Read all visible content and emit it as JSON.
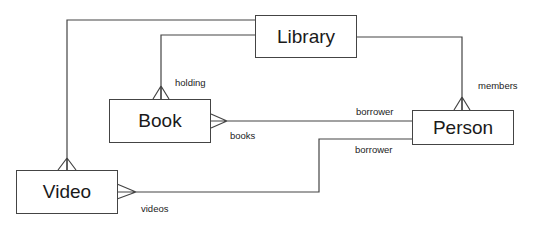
{
  "diagram": {
    "type": "entity-relationship",
    "line_color": "#444444",
    "entities": [
      {
        "id": "library",
        "label": "Library"
      },
      {
        "id": "book",
        "label": "Book"
      },
      {
        "id": "person",
        "label": "Person"
      },
      {
        "id": "video",
        "label": "Video"
      }
    ],
    "relationships": [
      {
        "from": "library",
        "to": "book",
        "role": "holding",
        "many_end": "book"
      },
      {
        "from": "library",
        "to": "video",
        "role": "",
        "many_end": "video"
      },
      {
        "from": "library",
        "to": "person",
        "role": "members",
        "many_end": "person"
      },
      {
        "from": "book",
        "to": "person",
        "roles": [
          "books",
          "borrower"
        ],
        "many_end": "book"
      },
      {
        "from": "video",
        "to": "person",
        "roles": [
          "videos",
          "borrower"
        ],
        "many_end": "video"
      }
    ],
    "labels": {
      "holding": "holding",
      "members": "members",
      "books": "books",
      "borrower_book": "borrower",
      "borrower_video": "borrower",
      "videos": "videos"
    }
  }
}
